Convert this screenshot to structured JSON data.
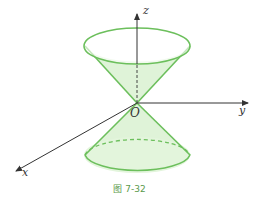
{
  "figure": {
    "caption": "图 7-32",
    "axes": {
      "x": "x",
      "y": "y",
      "z": "z",
      "origin": "O"
    },
    "colors": {
      "cone_stroke": "#6cbf5c",
      "cone_fill": "#dff3d8",
      "axis": "#333333",
      "caption": "#5a9a4a"
    }
  }
}
